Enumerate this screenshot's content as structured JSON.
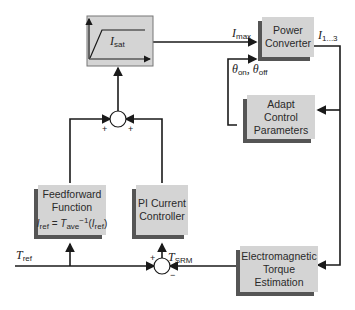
{
  "blocks": {
    "saturation": {
      "label_main": "I",
      "label_sub": "sat"
    },
    "power_converter": {
      "line1": "Power",
      "line2": "Converter"
    },
    "adapt": {
      "line1": "Adapt",
      "line2": "Control",
      "line3": "Parameters"
    },
    "feedforward": {
      "line1": "Feedforward",
      "line2": "Function",
      "eq_a": "I",
      "eq_a_sub": "ref",
      "eq_eq": " = ",
      "eq_t": "T",
      "eq_t_sub": "ave",
      "eq_sup": "−1",
      "eq_open": "(",
      "eq_b": "I",
      "eq_b_sub": "ref",
      "eq_close": ")"
    },
    "pi": {
      "line1": "PI Current",
      "line2": "Controller"
    },
    "torque_est": {
      "line1": "Electromagnetic",
      "line2": "Torque",
      "line3": "Estimation"
    }
  },
  "signals": {
    "imax": {
      "main": "I",
      "sub": "max"
    },
    "i13": {
      "main": "I",
      "sub": "1...3"
    },
    "theta": {
      "a": "θ",
      "a_sub": "on",
      "sep": ", ",
      "b": "θ",
      "b_sub": "off"
    },
    "tref": {
      "main": "T",
      "sub": "ref"
    },
    "tsrm": {
      "main": "T",
      "sub": "SRM"
    }
  },
  "junction_signs": {
    "top_left": "+",
    "top_right": "+",
    "bottom_plus": "+",
    "bottom_minus": "−"
  },
  "colors": {
    "block_fill": "#d4d4d4",
    "shadow": "#555555",
    "line": "#1a1a1a"
  }
}
